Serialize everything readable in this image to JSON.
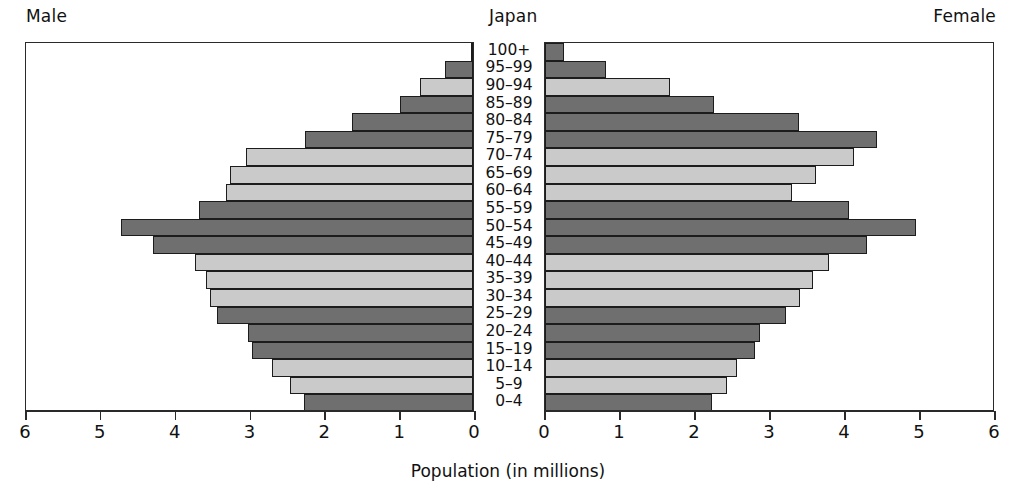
{
  "labels": {
    "male": "Male",
    "female": "Female",
    "country": "Japan",
    "axis_title": "Population (in millions)"
  },
  "colors": {
    "bar_dark": "#6f6f6f",
    "bar_light": "#cacaca",
    "outline": "#1c1c1c",
    "frame": "#2a2a2a",
    "background": "#ffffff"
  },
  "axis": {
    "tick_labels_male": [
      "6",
      "5",
      "4",
      "3",
      "2",
      "1",
      "0"
    ],
    "tick_labels_female": [
      "0",
      "1",
      "2",
      "3",
      "4",
      "5",
      "6"
    ],
    "max": 6,
    "unit": "millions"
  },
  "chart_data": {
    "type": "bar",
    "subtype": "population-pyramid",
    "title": "Japan",
    "xlabel": "Population (in millions)",
    "ylabel": "",
    "xlim": [
      0,
      6
    ],
    "grid": false,
    "legend_position": "none",
    "categories": [
      "100+",
      "95–99",
      "90–94",
      "85–89",
      "80–84",
      "75–79",
      "70–74",
      "65–69",
      "60–64",
      "55–59",
      "50–54",
      "45–49",
      "40–44",
      "35–39",
      "30–34",
      "25–29",
      "20–24",
      "15–19",
      "10–14",
      "5–9",
      "0–4"
    ],
    "series": [
      {
        "name": "Male",
        "side": "left",
        "values": [
          0.02,
          0.38,
          0.71,
          0.98,
          1.62,
          2.24,
          3.04,
          3.25,
          3.3,
          3.66,
          4.7,
          4.28,
          3.72,
          3.57,
          3.52,
          3.42,
          3.01,
          2.95,
          2.68,
          2.45,
          2.26
        ]
      },
      {
        "name": "Female",
        "side": "right",
        "values": [
          0.25,
          0.81,
          1.66,
          2.25,
          3.38,
          4.42,
          4.12,
          3.61,
          3.29,
          4.05,
          4.95,
          4.29,
          3.78,
          3.57,
          3.4,
          3.21,
          2.87,
          2.8,
          2.56,
          2.43,
          2.23
        ]
      }
    ],
    "bar_shades": [
      "dark",
      "dark",
      "light",
      "dark",
      "dark",
      "dark",
      "light",
      "light",
      "light",
      "dark",
      "dark",
      "dark",
      "light",
      "light",
      "light",
      "dark",
      "dark",
      "dark",
      "light",
      "light",
      "dark"
    ]
  }
}
